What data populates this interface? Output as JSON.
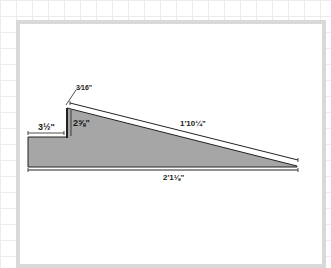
{
  "diagram": {
    "type": "ramp cross-section",
    "colors": {
      "fill": "#a6a6a6",
      "stroke": "#222222",
      "frame": "#d9d9d9",
      "grid": "#ececec"
    },
    "dimensions": {
      "step_width": "3½\"",
      "step_height": "2⅝\"",
      "top_thickness": "3⁄16\"",
      "slope_length": "1'10¼\"",
      "total_length": "2'1⅛\""
    }
  }
}
